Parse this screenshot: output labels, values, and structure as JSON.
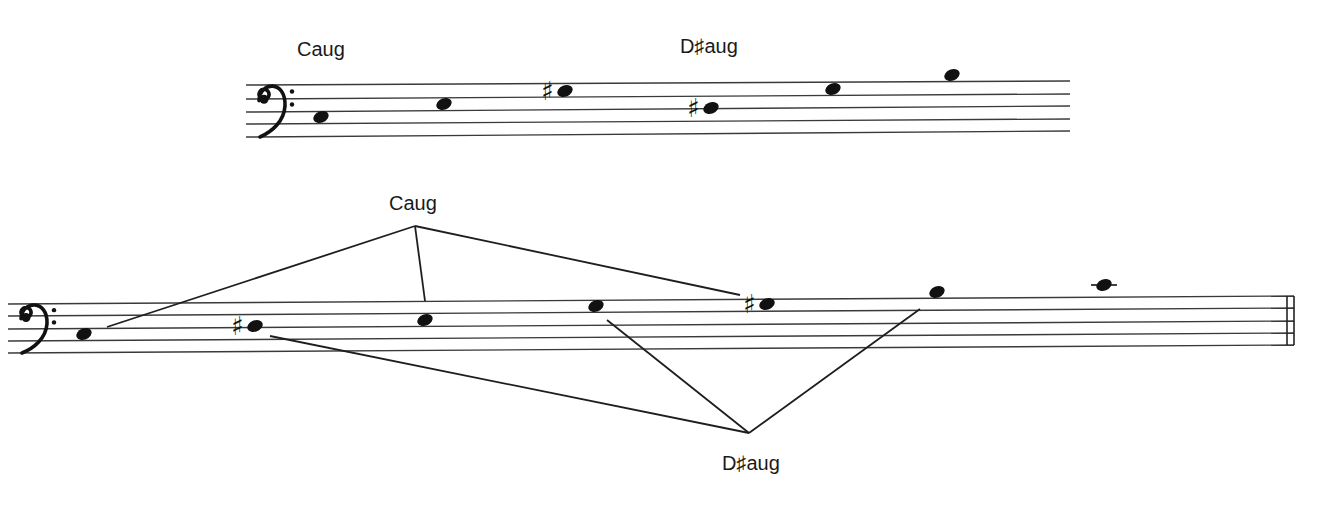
{
  "top_system": {
    "clef": "bass",
    "labels": [
      {
        "text": "Caug",
        "x": 297,
        "y": 56
      },
      {
        "text": "D♯aug",
        "x": 680,
        "y": 53
      }
    ],
    "staff": {
      "x1": 246,
      "x2": 1070,
      "lines_left": [
        85,
        99,
        112,
        124,
        137
      ],
      "lines_right": [
        81,
        94,
        106,
        119,
        131
      ]
    },
    "notes": [
      {
        "name": "C",
        "x": 321,
        "y": 117,
        "sharp": false
      },
      {
        "name": "E",
        "x": 444,
        "y": 104,
        "sharp": false
      },
      {
        "name": "G#",
        "x": 565,
        "y": 91,
        "sharp": true
      },
      {
        "name": "D#",
        "x": 711,
        "y": 108,
        "sharp": true
      },
      {
        "name": "Fx/G",
        "x": 833,
        "y": 89,
        "sharp": false
      },
      {
        "name": "A#/B",
        "x": 952,
        "y": 75,
        "sharp": false
      }
    ]
  },
  "bottom_system": {
    "clef": "bass",
    "labels": [
      {
        "text": "Caug",
        "x": 389,
        "y": 210
      },
      {
        "text": "D♯aug",
        "x": 722,
        "y": 470
      }
    ],
    "staff": {
      "x1": 8,
      "x2": 1294,
      "lines_left": [
        304,
        316,
        329,
        341,
        353
      ],
      "lines_right": [
        296,
        308,
        321,
        333,
        345
      ]
    },
    "final_barline": true,
    "notes": [
      {
        "name": "C",
        "x": 84,
        "y": 334,
        "sharp": false
      },
      {
        "name": "D#",
        "x": 255,
        "y": 326,
        "sharp": true
      },
      {
        "name": "E",
        "x": 425,
        "y": 320,
        "sharp": false
      },
      {
        "name": "G",
        "x": 596,
        "y": 306,
        "sharp": false
      },
      {
        "name": "G#",
        "x": 767,
        "y": 304,
        "sharp": true
      },
      {
        "name": "B",
        "x": 937,
        "y": 292,
        "sharp": false
      },
      {
        "name": "C",
        "x": 1104,
        "y": 285,
        "sharp": false,
        "ledger": true
      }
    ],
    "connectors": {
      "Caug": {
        "apex": [
          415,
          226
        ],
        "targets": [
          [
            107,
            327
          ],
          [
            425,
            301
          ],
          [
            740,
            295
          ]
        ]
      },
      "D#aug": {
        "apex": [
          749,
          433
        ],
        "targets": [
          [
            270,
            336
          ],
          [
            607,
            320
          ],
          [
            920,
            309
          ]
        ]
      }
    }
  }
}
